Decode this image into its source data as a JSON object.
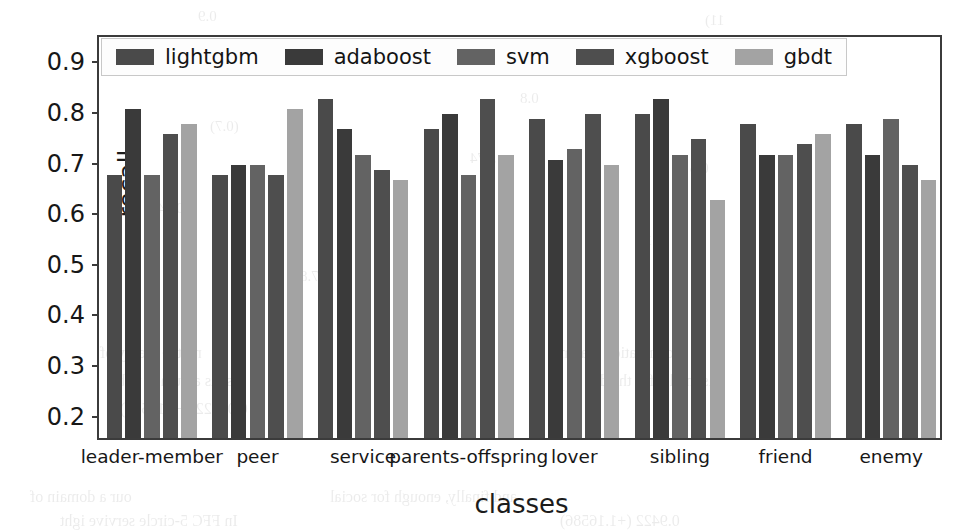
{
  "chart_data": {
    "type": "bar",
    "title": "",
    "xlabel": "classes",
    "ylabel": "recall",
    "ylim": [
      0.15,
      0.95
    ],
    "yticks": [
      0.9,
      0.8,
      0.7,
      0.6,
      0.5,
      0.4,
      0.3,
      0.2
    ],
    "ytick_labels": [
      "0.9",
      "0.8",
      "0.7",
      "0.6",
      "0.5",
      "0.4",
      "0.3",
      "0.2"
    ],
    "grid": false,
    "legend_position": "upper-left-inside",
    "categories": [
      "leader-member",
      "peer",
      "service",
      "parents-offspring",
      "lover",
      "sibling",
      "friend",
      "enemy"
    ],
    "series": [
      {
        "name": "lightgbm",
        "color": "#4a4a4a",
        "values": [
          0.67,
          0.67,
          0.82,
          0.76,
          0.78,
          0.79,
          0.77,
          0.77
        ]
      },
      {
        "name": "adaboost",
        "color": "#3a3a3a",
        "values": [
          0.8,
          0.69,
          0.76,
          0.79,
          0.7,
          0.82,
          0.71,
          0.71
        ]
      },
      {
        "name": "svm",
        "color": "#636363",
        "values": [
          0.67,
          0.69,
          0.71,
          0.67,
          0.72,
          0.71,
          0.71,
          0.78
        ]
      },
      {
        "name": "xgboost",
        "color": "#4e4e4e",
        "values": [
          0.75,
          0.67,
          0.68,
          0.82,
          0.79,
          0.74,
          0.73,
          0.69
        ]
      },
      {
        "name": "gbdt",
        "color": "#a3a3a3",
        "values": [
          0.77,
          0.8,
          0.66,
          0.71,
          0.69,
          0.62,
          0.75,
          0.66
        ]
      }
    ]
  },
  "legend": {
    "items": [
      {
        "label": "lightgbm"
      },
      {
        "label": "adaboost"
      },
      {
        "label": "svm"
      },
      {
        "label": "xgboost"
      },
      {
        "label": "gbdt"
      }
    ]
  },
  "axes": {
    "y_title": "recall",
    "x_title": "classes"
  },
  "background_text": [
    {
      "text": "0.9",
      "x": 198,
      "y": 8,
      "size": 15
    },
    {
      "text": "11)",
      "x": 705,
      "y": 12,
      "size": 15
    },
    {
      "text": "0.8",
      "x": 520,
      "y": 90,
      "size": 15
    },
    {
      "text": "(0.7)",
      "x": 210,
      "y": 118,
      "size": 15
    },
    {
      "text": "5.74",
      "x": 470,
      "y": 150,
      "size": 15
    },
    {
      "text": "0.6",
      "x": 690,
      "y": 160,
      "size": 15
    },
    {
      "text": "0.345",
      "x": 150,
      "y": 200,
      "size": 15
    },
    {
      "text": "(91)",
      "x": 640,
      "y": 232,
      "size": 15
    },
    {
      "text": "27.8",
      "x": 300,
      "y": 268,
      "size": 15
    },
    {
      "text": "nd the theory of",
      "x": 100,
      "y": 344,
      "size": 16
    },
    {
      "text": "correlation that m",
      "x": 560,
      "y": 344,
      "size": 16
    },
    {
      "text": "se is assumed to be",
      "x": 110,
      "y": 372,
      "size": 16
    },
    {
      "text": "is model for the d",
      "x": 600,
      "y": 372,
      "size": 16
    },
    {
      "text": "0.09422 (+1.16586)",
      "x": 120,
      "y": 400,
      "size": 16
    },
    {
      "text": "and finally, enough for social",
      "x": 330,
      "y": 488,
      "size": 16
    },
    {
      "text": "our a domain of",
      "x": 30,
      "y": 488,
      "size": 16
    },
    {
      "text": "In  FFC   5-circle   servive   ight",
      "x": 60,
      "y": 512,
      "size": 16
    },
    {
      "text": "0.9422 (+1.16586)",
      "x": 560,
      "y": 512,
      "size": 16
    }
  ]
}
